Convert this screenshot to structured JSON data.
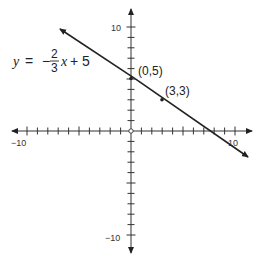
{
  "graph": {
    "equation": {
      "lhs": "y",
      "equals": "=",
      "sign": "−",
      "numerator": "2",
      "denominator": "3",
      "variable": "x",
      "rest": "+ 5"
    },
    "axes": {
      "x_min_label": "−10",
      "x_max_label": "10",
      "y_max_label": "10",
      "y_min_label": "−10"
    },
    "points": [
      {
        "label": "(0,5)",
        "x": 0,
        "y": 5
      },
      {
        "label": "(3,3)",
        "x": 3,
        "y": 3
      }
    ]
  },
  "chart_data": {
    "type": "line",
    "xlabel": "",
    "ylabel": "",
    "xlim": [
      -10,
      10
    ],
    "ylim": [
      -10,
      10
    ],
    "grid": false,
    "tick_spacing": 1,
    "tick_labels": {
      "x": [
        "-10",
        "10"
      ],
      "y": [
        "10",
        "-10"
      ]
    },
    "series": [
      {
        "name": "y = -2/3 x + 5",
        "slope": -0.6667,
        "intercept": 5,
        "x": [
          -7,
          11
        ],
        "y": [
          9.67,
          -2.33
        ]
      }
    ],
    "annotated_points": [
      {
        "label": "(0,5)",
        "x": 0,
        "y": 5
      },
      {
        "label": "(3,3)",
        "x": 3,
        "y": 3
      }
    ]
  }
}
